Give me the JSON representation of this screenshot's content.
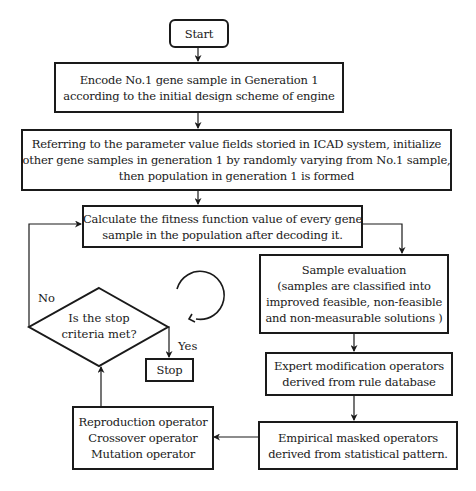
{
  "flowchart": {
    "start": {
      "label": "Start"
    },
    "encode": {
      "lines": [
        "Encode No.1 gene sample in Generation 1",
        "according to the initial design scheme of engine"
      ]
    },
    "initialize": {
      "lines": [
        "Referring to the parameter value fields storied in ICAD system, initialize",
        "other gene samples in generation 1 by randomly varying from No.1 sample,",
        "then population in generation 1 is formed"
      ]
    },
    "fitness": {
      "lines": [
        "Calculate the fitness function value of every gene",
        "sample in the population after decoding it."
      ]
    },
    "evaluation": {
      "lines": [
        "Sample evaluation",
        "(samples are classified into",
        "improved feasible, non-feasible",
        "and  non-measurable  solutions )"
      ]
    },
    "expert": {
      "lines": [
        "Expert modification operators",
        "derived from rule database"
      ]
    },
    "empirical": {
      "lines": [
        "Empirical masked operators",
        "derived from statistical pattern."
      ]
    },
    "genetic_ops": {
      "lines": [
        "Reproduction  operator",
        "Crossover  operator",
        "Mutation operator"
      ]
    },
    "decision": {
      "lines": [
        "Is the stop",
        "criteria met?"
      ],
      "yes_label": "Yes",
      "no_label": "No"
    },
    "stop": {
      "label": "Stop"
    },
    "cycle_icon": "clockwise-circular-arrow",
    "colors": {
      "stroke": "#1a1a1a",
      "background": "#ffffff"
    }
  }
}
